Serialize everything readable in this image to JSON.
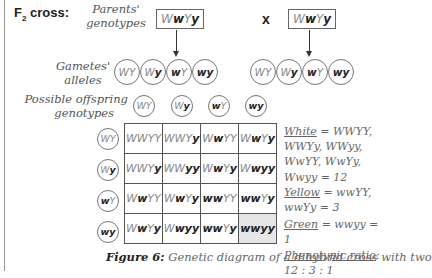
{
  "title": {
    "prefix": "F",
    "subscript": "2",
    "suffix": " cross:"
  },
  "labels": {
    "parents_line1": "Parents'",
    "parents_line2": "genotypes",
    "gametes_line1": "Gametes'",
    "gametes_line2": "alleles",
    "offspring_line1": "Possible offspring",
    "offspring_line2": "genotypes",
    "cross_symbol": "x"
  },
  "parents": [
    [
      {
        "t": "W",
        "r": false
      },
      {
        "t": "w",
        "r": true
      },
      {
        "t": "Y",
        "r": false
      },
      {
        "t": "y",
        "r": true
      }
    ],
    [
      {
        "t": "W",
        "r": false
      },
      {
        "t": "w",
        "r": true
      },
      {
        "t": "Y",
        "r": false
      },
      {
        "t": "y",
        "r": true
      }
    ]
  ],
  "gametes": [
    [
      [
        {
          "t": "W",
          "r": false
        },
        {
          "t": "Y",
          "r": false
        }
      ],
      [
        {
          "t": "W",
          "r": false
        },
        {
          "t": "y",
          "r": true
        }
      ],
      [
        {
          "t": "w",
          "r": true
        },
        {
          "t": "Y",
          "r": false
        }
      ],
      [
        {
          "t": "w",
          "r": true
        },
        {
          "t": "y",
          "r": true
        }
      ]
    ],
    [
      [
        {
          "t": "W",
          "r": false
        },
        {
          "t": "Y",
          "r": false
        }
      ],
      [
        {
          "t": "W",
          "r": false
        },
        {
          "t": "y",
          "r": true
        }
      ],
      [
        {
          "t": "w",
          "r": true
        },
        {
          "t": "Y",
          "r": false
        }
      ],
      [
        {
          "t": "w",
          "r": true
        },
        {
          "t": "y",
          "r": true
        }
      ]
    ]
  ],
  "grid": {
    "col_headers": [
      "WY",
      "Wy",
      "wY",
      "wy"
    ],
    "row_headers": [
      "WY",
      "Wy",
      "wY",
      "wy"
    ],
    "cells": [
      [
        "WWYY",
        "WWYy",
        "WwYY",
        "WwYy"
      ],
      [
        "WWYy",
        "WWyy",
        "WwYy",
        "Wwyy"
      ],
      [
        "WwYY",
        "WwYy",
        "wwYY",
        "wwYy"
      ],
      [
        "WwYy",
        "Wwyy",
        "wwYy",
        "wwyy"
      ]
    ],
    "shaded_cell": [
      3,
      3
    ]
  },
  "legend": {
    "white_label": "White",
    "white_line1": " = WWYY,",
    "white_line2": "WWYy, WWyy,",
    "white_line3": "WwYY, WwYy,",
    "white_line4": "Wwyy  = 12",
    "yellow_label": "Yellow",
    "yellow_line1": " = wwYY,",
    "yellow_line2": "wwYy = 3",
    "green_label": "Green",
    "green_line": " = wwyy = 1",
    "ratio_label": "Phenotypic ratio",
    "ratio_colon": ":",
    "ratio_value": "12 : 3 : 1"
  },
  "caption": {
    "figure_label": "Figure 6:",
    "text": "  Genetic diagram of a dihybrid cross with two"
  },
  "colors": {
    "dominant": "#888888",
    "recessive": "#222222",
    "shaded": "#e6e6e6"
  }
}
